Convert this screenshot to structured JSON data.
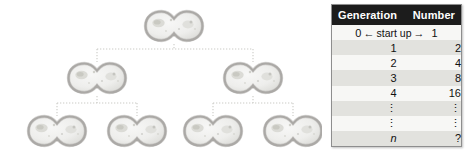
{
  "figure": {
    "diagram": {
      "name": "cell-division-tree",
      "description": "Binary tree of dividing cells",
      "levels": [
        {
          "generation": 0,
          "cell_count": 1
        },
        {
          "generation": 1,
          "cell_count": 2
        },
        {
          "generation": 2,
          "cell_count": 4
        }
      ],
      "cell_fill": "#efefed",
      "cell_outline": "#999795",
      "connector_color": "#c9c9c4"
    },
    "table": {
      "headers": {
        "generation": "Generation",
        "number": "Number"
      },
      "startup_row": {
        "generation": "0",
        "left_arrow": "←",
        "label": "start up",
        "right_arrow": "→",
        "number": "1"
      },
      "rows": [
        {
          "generation": "1",
          "number": "2",
          "italic": false
        },
        {
          "generation": "2",
          "number": "4",
          "italic": false
        },
        {
          "generation": "3",
          "number": "8",
          "italic": false
        },
        {
          "generation": "4",
          "number": "16",
          "italic": false
        },
        {
          "generation": "⋮",
          "number": "⋮",
          "italic": false
        },
        {
          "generation": "⋮",
          "number": "⋮",
          "italic": false
        },
        {
          "generation": "n",
          "number": "?",
          "italic": true
        }
      ],
      "header_bg": "#1c1c1c",
      "header_fg": "#ffffff",
      "row_shade": "#e2e2de",
      "row_plain": "#f7f7f5",
      "border_color": "#8e8e8e"
    }
  }
}
